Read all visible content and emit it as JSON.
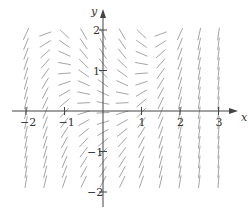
{
  "diagram": {
    "type": "slope-field",
    "axes": {
      "x_label": "x",
      "y_label": "y",
      "x_ticks": [
        {
          "value": -2,
          "label": "−2"
        },
        {
          "value": -1,
          "label": "−1"
        },
        {
          "value": 1,
          "label": "1"
        },
        {
          "value": 2,
          "label": "2"
        },
        {
          "value": 3,
          "label": "3"
        }
      ],
      "y_ticks": [
        {
          "value": 2,
          "label": "2"
        },
        {
          "value": 1,
          "label": "1"
        },
        {
          "value": -1,
          "label": "−1"
        },
        {
          "value": -2,
          "label": "−2"
        }
      ],
      "x_range": [
        -2.65,
        3.5
      ],
      "y_range": [
        -2.45,
        2.7
      ]
    },
    "grid": {
      "x_start": -2,
      "x_end": 3,
      "x_step": 0.5,
      "y_start": 1.9,
      "rows": 16,
      "y_step": 0.243
    },
    "colors": {
      "axis": "#444444",
      "segment": "#9a9a9a",
      "label": "#333333",
      "background": "#ffffff"
    }
  }
}
